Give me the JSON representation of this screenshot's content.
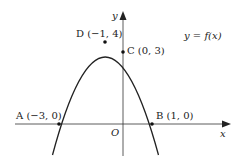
{
  "diagram": {
    "equation_label": "y = f(x)",
    "axes": {
      "x_label": "x",
      "y_label": "y",
      "origin_label": "O"
    },
    "points": [
      {
        "name": "A",
        "label": "A (−3, 0)",
        "x": -3,
        "y": 0
      },
      {
        "name": "B",
        "label": "B (1, 0)",
        "x": 1,
        "y": 0
      },
      {
        "name": "C",
        "label": "C (0, 3)",
        "x": 0,
        "y": 3
      },
      {
        "name": "D",
        "label": "D (−1, 4)",
        "x": -1,
        "y": 4
      }
    ],
    "curve": {
      "type": "parabola",
      "opens": "down",
      "vertex": "D"
    },
    "colors": {
      "ink": "#222222",
      "background": "#ffffff"
    }
  }
}
